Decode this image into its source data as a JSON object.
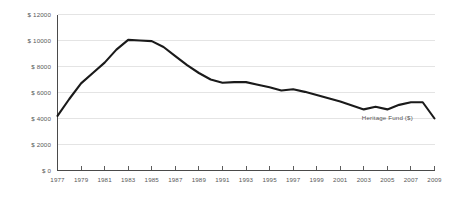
{
  "chart_data": {
    "type": "line",
    "title": "",
    "subtitle": "",
    "xlabel": "",
    "ylabel": "",
    "grid": true,
    "legend_position": "inline-right",
    "xlim": [
      1977,
      2009
    ],
    "ylim": [
      0,
      12000
    ],
    "y_ticks": [
      0,
      2000,
      4000,
      6000,
      8000,
      10000,
      12000
    ],
    "y_tick_labels": [
      "$ 0",
      "$ 2000",
      "$ 4000",
      "$ 6000",
      "$ 8000",
      "$ 10000",
      "$ 12000"
    ],
    "x_ticks": [
      1977,
      1979,
      1981,
      1983,
      1985,
      1987,
      1989,
      1991,
      1993,
      1995,
      1997,
      1999,
      2001,
      2003,
      2005,
      2007,
      2009
    ],
    "x_tick_labels": [
      "1977",
      "1979",
      "1981",
      "1983",
      "1985",
      "1987",
      "1989",
      "1991",
      "1993",
      "1995",
      "1997",
      "1999",
      "2001",
      "2003",
      "2005",
      "2007",
      "2009"
    ],
    "series": [
      {
        "name": "Heritage Fund ($)",
        "color": "#1a1a1a",
        "x": [
          1977,
          1978,
          1979,
          1980,
          1981,
          1982,
          1983,
          1984,
          1985,
          1986,
          1987,
          1988,
          1989,
          1990,
          1991,
          1992,
          1993,
          1994,
          1995,
          1996,
          1997,
          1998,
          1999,
          2000,
          2001,
          2002,
          2003,
          2004,
          2005,
          2006,
          2007,
          2008,
          2009
        ],
        "values": [
          4200,
          5500,
          6700,
          7500,
          8300,
          9300,
          10050,
          10000,
          9950,
          9500,
          8800,
          8100,
          7500,
          7000,
          6750,
          6800,
          6800,
          6600,
          6400,
          6150,
          6250,
          6050,
          5800,
          5550,
          5300,
          5000,
          4700,
          4900,
          4700,
          5050,
          5250,
          5250,
          4000
        ]
      }
    ],
    "annotations": [
      {
        "text": "Heritage Fund ($)",
        "x": 2005,
        "y": 3900
      }
    ],
    "colors": {
      "line": "#1a1a1a",
      "grid": "#d9d9d9",
      "axis": "#4a4a4a",
      "text": "#585858",
      "background": "#ffffff"
    }
  },
  "legend": {
    "series_label": "Heritage Fund ($)"
  }
}
